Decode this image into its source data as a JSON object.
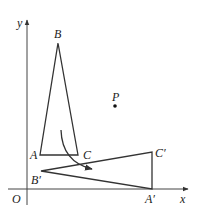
{
  "diagram": {
    "axes": {
      "x_label": "x",
      "y_label": "y",
      "origin_label": "O"
    },
    "points": {
      "A": "A",
      "B": "B",
      "C": "C",
      "A_prime": "A′",
      "B_prime": "B′",
      "C_prime": "C′",
      "P": "P"
    },
    "triangles": [
      {
        "name": "ABC",
        "vertices": [
          "A",
          "B",
          "C"
        ]
      },
      {
        "name": "A'B'C'",
        "vertices": [
          "A′",
          "B′",
          "C′"
        ]
      }
    ],
    "arrow": "rotation direction from ABC to A'B'C'"
  }
}
